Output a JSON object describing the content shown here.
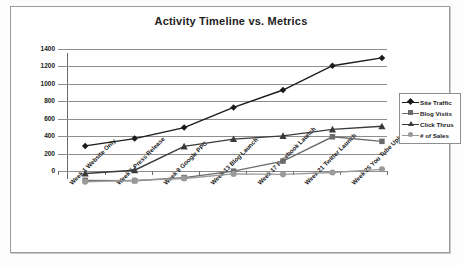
{
  "chart_data": {
    "type": "line",
    "title": "Activity Timeline vs. Metrics",
    "xlabel": "",
    "ylabel": "",
    "ylim": [
      0,
      1400
    ],
    "ytick_step": 200,
    "yticks": [
      1400,
      1200,
      1000,
      800,
      600,
      400,
      200,
      0
    ],
    "grid": true,
    "legend_position": "right",
    "categories": [
      "Week 1 Website Only",
      "Week 5 Press Release",
      "Week 9 Google PPC",
      "Week 13 Blog Launch",
      "Week 17 Facebook Launch",
      "Week 21 Twitter Launch",
      "Week 25 You Tube Uploads"
    ],
    "series": [
      {
        "name": "Site Traffic",
        "marker": "diamond",
        "color": "#1a1a1a",
        "values": [
          400,
          480,
          600,
          820,
          1010,
          1275,
          1360
        ]
      },
      {
        "name": "Blog Visits",
        "marker": "square",
        "color": "#6b6b6b",
        "values": [
          25,
          20,
          55,
          125,
          235,
          500,
          450
        ]
      },
      {
        "name": "Click Thrus",
        "marker": "triangle",
        "color": "#3a3a3a",
        "values": [
          100,
          135,
          395,
          475,
          510,
          580,
          615
        ]
      },
      {
        "name": "# of Sales",
        "marker": "circle",
        "color": "#9a9a9a",
        "values": [
          10,
          25,
          45,
          95,
          90,
          110,
          145
        ]
      }
    ]
  },
  "colors": {
    "site_traffic": "#1a1a1a",
    "blog_visits": "#6b6b6b",
    "click_thrus": "#3a3a3a",
    "num_of_sales": "#9a9a9a",
    "gridline": "#8e8e8e",
    "axis": "#6d6d6d",
    "frame_border": "#9a9a9a",
    "background": "#ffffff"
  }
}
